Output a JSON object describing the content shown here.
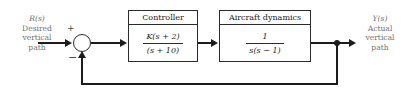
{
  "diagram": {
    "type": "control-system-block-diagram",
    "width": 410,
    "height": 92,
    "line_color": "#1c1c1c",
    "label_color": "#6f6f6f",
    "background": "#ffffff"
  },
  "input": {
    "signal": "R(s)",
    "line1": "Desired",
    "line2": "vertical",
    "line3": "path"
  },
  "output": {
    "signal": "Y(s)",
    "line1": "Actual",
    "line2": "vertical",
    "line3": "path"
  },
  "summing_junction": {
    "name": "summing-junction",
    "plus": "+",
    "minus": "−"
  },
  "blocks": [
    {
      "id": "controller",
      "title": "Controller",
      "numerator": "K(s + 2)",
      "denominator": "(s + 10)"
    },
    {
      "id": "aircraft",
      "title": "Aircraft dynamics",
      "numerator": "1",
      "denominator": "s(s − 1)"
    }
  ],
  "feedback": {
    "name": "unity-feedback-path",
    "gain": "1"
  }
}
